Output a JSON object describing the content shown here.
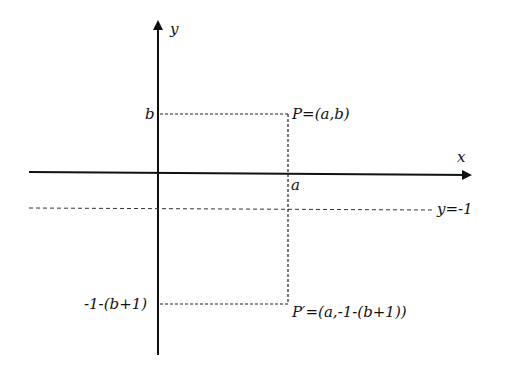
{
  "diagram": {
    "axes": {
      "x_label": "x",
      "y_label": "y"
    },
    "lines": {
      "horizontal_line_label": "y=-1"
    },
    "points": {
      "P": {
        "label": "P=(a,b)"
      },
      "P_prime": {
        "label": "P′=(a,-1-(b+1))"
      }
    },
    "ticks": {
      "x_a": "a",
      "y_b": "b",
      "y_reflected": "-1-(b+1)"
    },
    "colors": {
      "axis": "#111111",
      "dashed": "#222222",
      "background": "#ffffff"
    }
  }
}
